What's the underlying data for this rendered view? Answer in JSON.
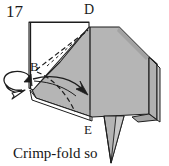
{
  "figure": {
    "step_number": "17",
    "caption": "Crimp-fold so",
    "point_labels": {
      "d": "D",
      "b": "B",
      "e": "E"
    },
    "colors": {
      "paper_fill": "#b3b3b3",
      "paper_fill_light": "#c2c2c2",
      "paper_fill_shadow": "#a0a0a0",
      "white_side": "#ffffff",
      "outline": "#1a1a1a",
      "background": "#ffffff"
    },
    "icons": {
      "rotate_arrow": "rotation-arrow-icon",
      "fold_arrow": "fold-direction-arrow-icon",
      "valley_fold": "dashed-fold-line-icon",
      "tail_flap": "triangular-flap-icon"
    },
    "geometry": {
      "body_outline": "M 30,92 L 88,26 L 118,26 L 148,56 L 148,115 L 92,115 L 30,92 Z",
      "top_vertex": "D",
      "left_vertex": "B",
      "bottom_vertex": "E"
    }
  }
}
